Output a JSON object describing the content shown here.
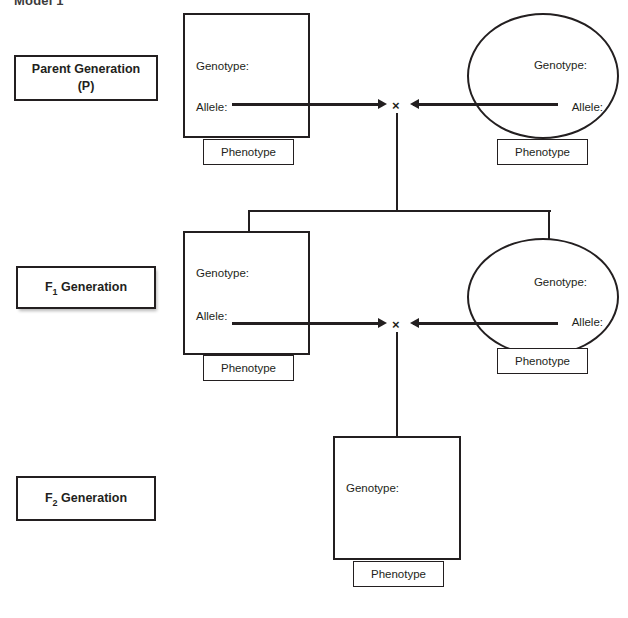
{
  "figure": {
    "title": "Model 1"
  },
  "labels": {
    "genotype": "Genotype:",
    "allele": "Allele:",
    "phenotype": "Phenotype",
    "cross_symbol": "×"
  },
  "generations": [
    {
      "id": "p",
      "name_line1": "Parent Generation",
      "name_line2": "(P)",
      "parents": [
        {
          "shape": "square",
          "genotype_label": "Genotype:",
          "genotype_value": "",
          "allele_label": "Allele:",
          "allele_value": "",
          "phenotype_label": "Phenotype",
          "phenotype_value": ""
        },
        {
          "shape": "circle",
          "genotype_label": "Genotype:",
          "genotype_value": "",
          "allele_label": "Allele:",
          "allele_value": "",
          "phenotype_label": "Phenotype",
          "phenotype_value": ""
        }
      ],
      "cross_symbol": "×"
    },
    {
      "id": "f1",
      "name_prefix": "F",
      "name_subscript": "1",
      "name_suffix": " Generation",
      "parents": [
        {
          "shape": "square",
          "genotype_label": "Genotype:",
          "genotype_value": "",
          "allele_label": "Allele:",
          "allele_value": "",
          "phenotype_label": "Phenotype",
          "phenotype_value": ""
        },
        {
          "shape": "circle",
          "genotype_label": "Genotype:",
          "genotype_value": "",
          "allele_label": "Allele:",
          "allele_value": "",
          "phenotype_label": "Phenotype",
          "phenotype_value": ""
        }
      ],
      "cross_symbol": "×"
    },
    {
      "id": "f2",
      "name_prefix": "F",
      "name_subscript": "2",
      "name_suffix": " Generation",
      "offspring": {
        "shape": "square",
        "genotype_label": "Genotype:",
        "genotype_value": "",
        "phenotype_label": "Phenotype",
        "phenotype_value": ""
      }
    }
  ],
  "colors": {
    "ink": "#231f20",
    "paper": "#ffffff",
    "title": "#3c3c3c"
  }
}
